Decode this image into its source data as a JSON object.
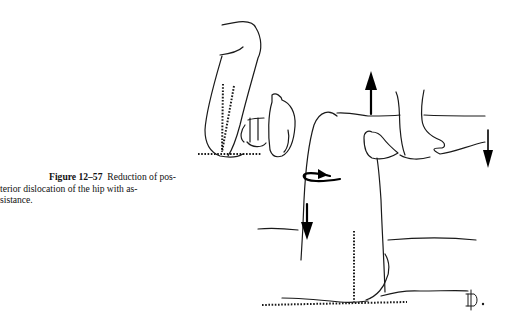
{
  "figure": {
    "label": "Figure 12–57",
    "caption_line1": "Reduction of pos-",
    "caption_line2": "terior dislocation of the hip with as-",
    "caption_line3": "sistance.",
    "illustration": "hip-reduction-line-drawing",
    "signature": "monogram-signature",
    "colors": {
      "ink": "#1a1a1a",
      "background": "#ffffff"
    }
  }
}
